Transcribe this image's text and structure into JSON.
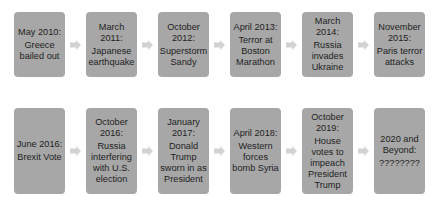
{
  "colors": {
    "box_fill": "#a7a7a7",
    "arrow_fill": "#d3d3d3",
    "text": "#1e1e1e",
    "background": "#ffffff"
  },
  "timeline": {
    "row1": [
      {
        "date": "May 2010:",
        "event": "Greece bailed out"
      },
      {
        "date": "March 2011:",
        "event": "Japanese earthquake"
      },
      {
        "date": "October 2012:",
        "event": "Superstorm Sandy"
      },
      {
        "date": "April 2013:",
        "event": "Terror at Boston Marathon"
      },
      {
        "date": "March 2014:",
        "event": "Russia invades Ukraine"
      },
      {
        "date": "November 2015:",
        "event": "Paris terror attacks"
      }
    ],
    "row2": [
      {
        "date": "June 2016:",
        "event": "Brexit Vote"
      },
      {
        "date": "October 2016:",
        "event": "Russia interfering with U.S. election"
      },
      {
        "date": "January 2017:",
        "event": "Donald Trump sworn in as President"
      },
      {
        "date": "April 2018:",
        "event": "Western forces bomb Syria"
      },
      {
        "date": "October 2019:",
        "event": "House votes to impeach President Trump"
      },
      {
        "date": "2020 and Beyond:",
        "event": "????????"
      }
    ],
    "arrow_icon": "right-arrow-icon"
  }
}
